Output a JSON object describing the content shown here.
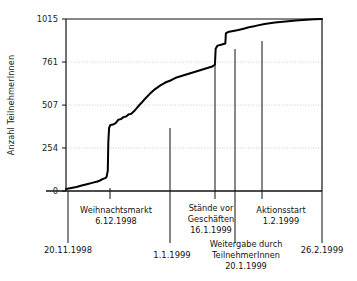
{
  "figure": {
    "background": "#ffffff",
    "ink": "#111111",
    "grid_color": "#b8b8b8",
    "curve_color": "#000000"
  },
  "axes": {
    "y_label": "Anzahl TeilnehmerInnen",
    "y_ticks": [
      0,
      254,
      507,
      761,
      1015
    ],
    "y_tick_labels": [
      "0",
      "254",
      "507",
      "761",
      "1015"
    ],
    "x_start_label": "20.11.1998",
    "x_end_label": "26.2.1999",
    "x_mid_label": "1.1.1999"
  },
  "annotations": [
    {
      "name": "weihnachtsmarkt",
      "lines": [
        "Weihnachtsmarkt",
        "6.12.1998"
      ],
      "date": "6.12.1998",
      "title": "Weihnachtsmarkt",
      "x_value": 16
    },
    {
      "name": "staende-vor-geschaeften",
      "lines": [
        "Stände vor",
        "Geschäften",
        "16.1.1999"
      ],
      "date": "16.1.1999",
      "title": "Stände vor Geschäften",
      "x_value": 57
    },
    {
      "name": "weitergabe-durch-teilnehmerinnen",
      "lines": [
        "Weitergabe durch",
        "TeilnehmerInnen",
        "20.1.1999"
      ],
      "date": "20.1.1999",
      "title": "Weitergabe durch TeilnehmerInnen",
      "x_value": 61
    },
    {
      "name": "aktionsstart",
      "lines": [
        "Aktionsstart",
        "1.2.1999"
      ],
      "date": "1.2.1999",
      "title": "Aktionsstart",
      "x_value": 73
    }
  ],
  "chart_data": {
    "type": "line",
    "title": "",
    "xlabel": "",
    "ylabel": "Anzahl TeilnehmerInnen",
    "ylim": [
      0,
      1015
    ],
    "xlim": [
      0,
      98
    ],
    "grid": "horizontal",
    "legend": "none",
    "x_tick_labels": [
      "20.11.1998",
      "1.1.1999",
      "26.2.1999"
    ],
    "y_tick_labels": [
      "0",
      "254",
      "507",
      "761",
      "1015"
    ],
    "x_unit": "days since 20.11.1998",
    "x_axis_dates": {
      "start": "20.11.1998",
      "end": "26.2.1999",
      "marked": [
        "20.11.1998",
        "6.12.1998",
        "1.1.1999",
        "16.1.1999",
        "20.1.1999",
        "1.2.1999",
        "26.2.1999"
      ]
    },
    "series": [
      {
        "name": "Kumulierte TeilnehmerInnen",
        "x": [
          0,
          2,
          4,
          6,
          8,
          10,
          12,
          13,
          14,
          15,
          15.5,
          16,
          16.2,
          16.5,
          17,
          18,
          19,
          20,
          21,
          22,
          23,
          24,
          25,
          26,
          27,
          28,
          29,
          30,
          31,
          32,
          34,
          36,
          38,
          40,
          41,
          42,
          56,
          56.5,
          57,
          57.3,
          58,
          59,
          60,
          61,
          61.2,
          62,
          64,
          66,
          68,
          70,
          72,
          73,
          76,
          80,
          84,
          88,
          92,
          95,
          98
        ],
        "values": [
          12,
          18,
          24,
          32,
          40,
          48,
          56,
          62,
          70,
          76,
          82,
          120,
          290,
          372,
          390,
          392,
          400,
          420,
          424,
          436,
          440,
          452,
          456,
          470,
          488,
          506,
          522,
          540,
          556,
          572,
          600,
          622,
          640,
          652,
          660,
          668,
          735,
          740,
          745,
          840,
          858,
          862,
          866,
          870,
          930,
          938,
          944,
          950,
          958,
          966,
          972,
          976,
          986,
          994,
          1000,
          1006,
          1010,
          1013,
          1015
        ]
      }
    ]
  }
}
